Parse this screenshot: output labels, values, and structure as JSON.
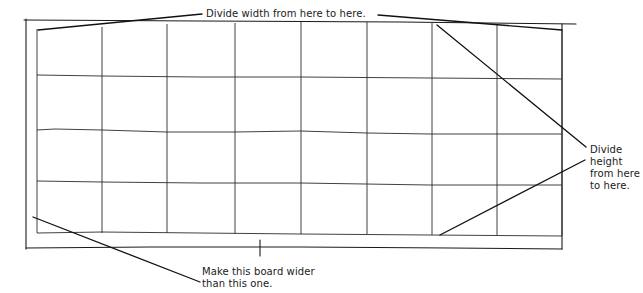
{
  "diagram": {
    "grid": {
      "columns": 8,
      "rows": 4,
      "column_x": [
        37,
        102,
        167,
        235,
        301,
        367,
        432,
        497,
        562
      ],
      "row_y": [
        30,
        77,
        131,
        183,
        234
      ],
      "outer_frame": {
        "left": 26,
        "top": 20,
        "right": 576,
        "bottom": 248
      }
    },
    "annotations": {
      "divide_width": "Divide width from here to here.",
      "divide_height_lines": [
        "Divide",
        "height",
        "from here",
        "to here."
      ],
      "board_wider_lines": [
        "Make this board wider",
        "than this one."
      ]
    },
    "colors": {
      "line": "#1a1a1a",
      "text": "#1a1a1a",
      "background": "#ffffff"
    }
  }
}
